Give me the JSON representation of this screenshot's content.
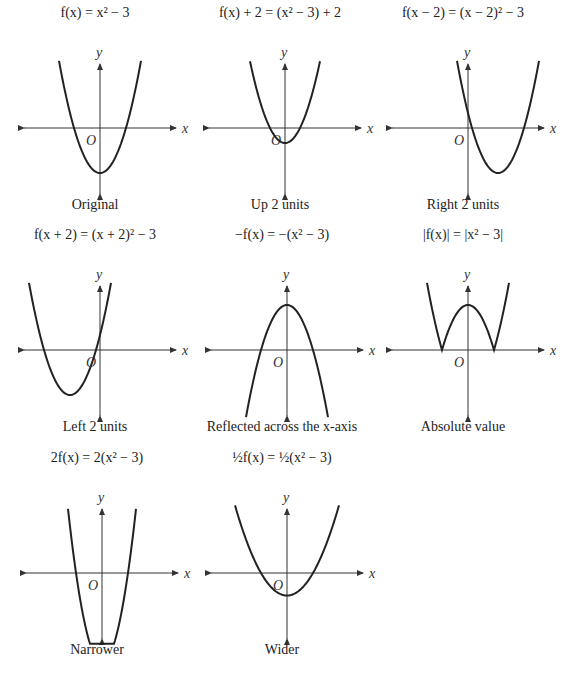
{
  "panels": [
    {
      "title": "f(x) = x² − 3",
      "caption": "Original",
      "fn": "orig",
      "left": 0,
      "top": 0,
      "ox": 100,
      "oy": 128
    },
    {
      "title": "f(x) + 2 = (x² − 3) + 2",
      "caption": "Up 2 units",
      "fn": "up",
      "left": 185,
      "top": 0,
      "ox": 100,
      "oy": 128
    },
    {
      "title": "f(x − 2) = (x − 2)² − 3",
      "caption": "Right 2 units",
      "fn": "right",
      "left": 368,
      "top": 0,
      "ox": 100,
      "oy": 128
    },
    {
      "title": "f(x + 2) = (x + 2)² − 3",
      "caption": "Left 2 units",
      "fn": "left",
      "left": 0,
      "top": 222,
      "ox": 100,
      "oy": 128
    },
    {
      "title": "−f(x) = −(x² − 3)",
      "caption": "Reflected across the x-axis",
      "fn": "neg",
      "left": 187,
      "top": 222,
      "ox": 100,
      "oy": 128
    },
    {
      "title": "|f(x)| = |x² − 3|",
      "caption": "Absolute value",
      "fn": "abs",
      "left": 368,
      "top": 222,
      "ox": 100,
      "oy": 128
    },
    {
      "title": "2f(x) = 2(x² − 3)",
      "caption": "Narrower",
      "fn": "narrow",
      "left": 2,
      "top": 445,
      "ox": 100,
      "oy": 128
    },
    {
      "title": "½f(x) = ½(x² − 3)",
      "caption": "Wider",
      "fn": "wide",
      "left": 187,
      "top": 445,
      "ox": 100,
      "oy": 128
    }
  ],
  "axis_labels": {
    "x": "x",
    "y": "y",
    "origin": "O"
  },
  "chart_data": {
    "type": "line",
    "series": [
      {
        "name": "f(x) = x² − 3",
        "label": "Original",
        "vertex": [
          0,
          -3
        ]
      },
      {
        "name": "f(x) + 2",
        "label": "Up 2 units",
        "vertex": [
          0,
          -1
        ]
      },
      {
        "name": "f(x − 2)",
        "label": "Right 2 units",
        "vertex": [
          2,
          -3
        ]
      },
      {
        "name": "f(x + 2)",
        "label": "Left 2 units",
        "vertex": [
          -2,
          -3
        ]
      },
      {
        "name": "−f(x)",
        "label": "Reflected across the x-axis",
        "vertex": [
          0,
          3
        ]
      },
      {
        "name": "|f(x)|",
        "label": "Absolute value",
        "vertex": [
          0,
          3
        ]
      },
      {
        "name": "2f(x)",
        "label": "Narrower",
        "vertex": [
          0,
          -6
        ]
      },
      {
        "name": "½f(x)",
        "label": "Wider",
        "vertex": [
          0,
          -1.5
        ]
      }
    ],
    "xlabel": "x",
    "ylabel": "y",
    "grid": false
  }
}
